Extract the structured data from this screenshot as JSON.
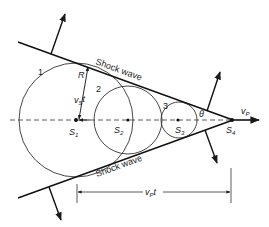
{
  "diagram": {
    "shock_label_upper": "Shock wave",
    "shock_label_lower": "Shock wave",
    "circle_labels": [
      "1",
      "2",
      "3"
    ],
    "source_labels": [
      {
        "base": "S",
        "sub": "1"
      },
      {
        "base": "S",
        "sub": "2"
      },
      {
        "base": "S",
        "sub": "3"
      },
      {
        "base": "S",
        "sub": "4"
      }
    ],
    "radius_label": "R",
    "sound_distance_label": {
      "base": "v",
      "sub": "S",
      "suffix": "t"
    },
    "source_velocity_label": {
      "base": "v",
      "sub": "P"
    },
    "source_distance_label": {
      "base": "v",
      "sub": "P",
      "suffix": "t"
    },
    "angle_label": "θ",
    "colors": {
      "line": "#1a1a1a",
      "background": "#ffffff"
    }
  }
}
